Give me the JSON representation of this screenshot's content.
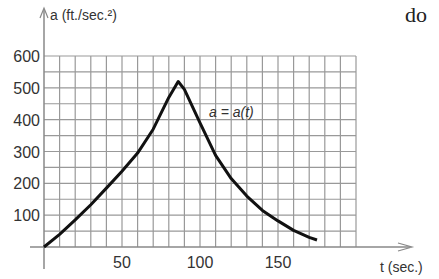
{
  "corner_text": "do",
  "chart_data": {
    "type": "line",
    "title": "",
    "xlabel": "t (sec.)",
    "ylabel": "a (ft./sec.²)",
    "curve_label": "a = a(t)",
    "xlim": [
      0,
      200
    ],
    "ylim": [
      0,
      600
    ],
    "x_ticks": [
      50,
      100,
      150
    ],
    "y_ticks": [
      100,
      200,
      300,
      400,
      500,
      600
    ],
    "grid": true,
    "grid_x_step": 10,
    "grid_y_step": 50,
    "series": [
      {
        "name": "a(t)",
        "x": [
          0,
          10,
          20,
          30,
          40,
          50,
          60,
          70,
          80,
          86,
          90,
          100,
          110,
          120,
          130,
          140,
          150,
          160,
          170,
          175
        ],
        "y": [
          0,
          40,
          85,
          133,
          185,
          238,
          295,
          370,
          470,
          520,
          495,
          390,
          288,
          215,
          160,
          115,
          82,
          52,
          30,
          22
        ]
      }
    ]
  }
}
